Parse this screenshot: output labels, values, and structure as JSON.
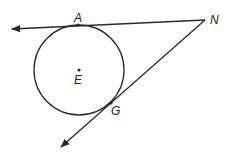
{
  "diagram": {
    "type": "geometry",
    "colors": {
      "stroke": "#2a2a2a",
      "background": "#ffffff"
    },
    "circle": {
      "center_label": "E",
      "cx": 79,
      "cy": 70,
      "r": 45
    },
    "points": {
      "A": {
        "label": "A",
        "x": 78,
        "y": 25
      },
      "N": {
        "label": "N",
        "x": 205,
        "y": 20
      },
      "G": {
        "label": "G",
        "x": 111,
        "y": 103
      },
      "E": {
        "label": "E",
        "x": 79,
        "y": 70
      }
    },
    "rays": [
      {
        "name": "ray-NA",
        "from": "N",
        "through": "A",
        "arrow_end": [
          11,
          29
        ]
      },
      {
        "name": "ray-NG",
        "from": "N",
        "through": "G",
        "arrow_end": [
          60,
          148
        ]
      }
    ]
  }
}
